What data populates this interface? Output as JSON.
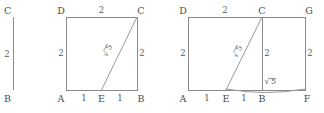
{
  "diagram": {
    "stroke_color": "#8a8a8a",
    "label_color": "#4a4a4a",
    "background": "#ffffff",
    "panels": [
      {
        "id": "panel-segment",
        "name": "vertical-segment-panel",
        "vertices": [
          {
            "key": "C",
            "label": "C"
          },
          {
            "key": "B",
            "label": "B"
          }
        ],
        "lengths": [
          {
            "key": "BC",
            "label": "2"
          }
        ]
      },
      {
        "id": "panel-square",
        "name": "square-panel",
        "vertices": [
          {
            "key": "D",
            "label": "D"
          },
          {
            "key": "C",
            "label": "C"
          },
          {
            "key": "A",
            "label": "A"
          },
          {
            "key": "E",
            "label": "E"
          },
          {
            "key": "B",
            "label": "B"
          }
        ],
        "lengths": [
          {
            "key": "DC",
            "label": "2"
          },
          {
            "key": "AD",
            "label": "2"
          },
          {
            "key": "BC",
            "label": "2"
          },
          {
            "key": "AE",
            "label": "1"
          },
          {
            "key": "EB",
            "label": "1"
          },
          {
            "key": "EC",
            "label": "5",
            "radical": true
          }
        ]
      },
      {
        "id": "panel-rectangle",
        "name": "rectangle-panel",
        "vertices": [
          {
            "key": "D",
            "label": "D"
          },
          {
            "key": "C",
            "label": "C"
          },
          {
            "key": "G",
            "label": "G"
          },
          {
            "key": "A",
            "label": "A"
          },
          {
            "key": "E",
            "label": "E"
          },
          {
            "key": "B",
            "label": "B"
          },
          {
            "key": "F",
            "label": "F"
          }
        ],
        "lengths": [
          {
            "key": "DC",
            "label": "2"
          },
          {
            "key": "AD",
            "label": "2"
          },
          {
            "key": "CB",
            "label": "2"
          },
          {
            "key": "GF",
            "label": "2"
          },
          {
            "key": "AE",
            "label": "1"
          },
          {
            "key": "EB",
            "label": "1"
          },
          {
            "key": "EC",
            "label": "5",
            "radical": true
          },
          {
            "key": "BF",
            "label": "5",
            "radical": true
          }
        ]
      }
    ]
  }
}
